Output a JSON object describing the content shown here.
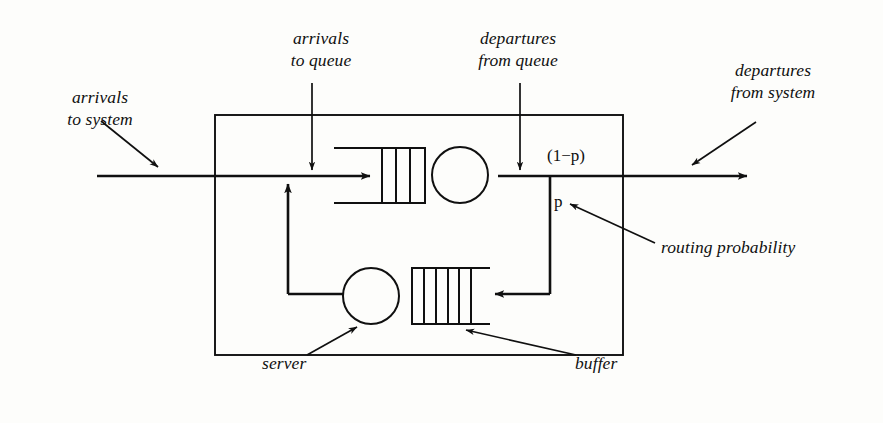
{
  "diagram": {
    "type": "queueing-network-schematic",
    "stroke_color": "#101010",
    "background_color": "#fdfdfb",
    "annotations": {
      "arrivals_to_system": "arrivals\nto system",
      "arrivals_to_queue": "arrivals\nto queue",
      "departures_from_queue": "departures\nfrom queue",
      "departures_from_system": "departures\nfrom system",
      "routing_probability": "routing probability",
      "server": "server",
      "buffer": "buffer"
    },
    "math_labels": {
      "complement_probability": "(1−p)",
      "probability": "p"
    },
    "components": {
      "system_boundary": "system-boundary-box",
      "upper_queue_slots": 3,
      "upper_server": "circle",
      "lower_buffer_slots": 5,
      "lower_server": "circle"
    },
    "flows": [
      "arrivals-to-system-inflow",
      "arrivals-to-queue-merge",
      "queue-to-server",
      "departures-from-queue",
      "routing-split",
      "feedback-to-buffer",
      "buffer-to-server-loop",
      "departures-from-system-outflow"
    ]
  }
}
